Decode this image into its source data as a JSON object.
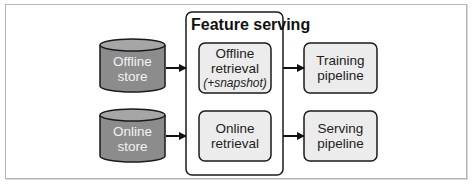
{
  "diagram": {
    "container": {
      "title": "Feature serving"
    },
    "stores": [
      {
        "line1": "Offline",
        "line2": "store"
      },
      {
        "line1": "Online",
        "line2": "store"
      }
    ],
    "retrieval": [
      {
        "line1": "Offline",
        "line2": "retrieval",
        "line3": "(+snapshot)"
      },
      {
        "line1": "Online",
        "line2": "retrieval"
      }
    ],
    "pipelines": [
      {
        "line1": "Training",
        "line2": "pipeline"
      },
      {
        "line1": "Serving",
        "line2": "pipeline"
      }
    ],
    "colors": {
      "cylinder_fill": "#8c8c8c",
      "cylinder_top": "#a6a6a6",
      "box_fill": "#ececec",
      "stroke": "#1a1a1a",
      "frame_border": "#b5b5b5"
    }
  }
}
